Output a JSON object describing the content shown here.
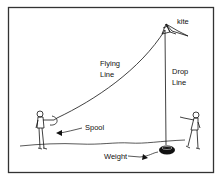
{
  "diagram": {
    "labels": {
      "kite": "kite",
      "flying_line_1": "Flying",
      "flying_line_2": "Line",
      "drop_line_1": "Drop",
      "drop_line_2": "Line",
      "spool": "Spool",
      "weight": "Weight"
    },
    "colors": {
      "ink": "#111111",
      "background": "#ffffff",
      "border": "#333333"
    }
  }
}
